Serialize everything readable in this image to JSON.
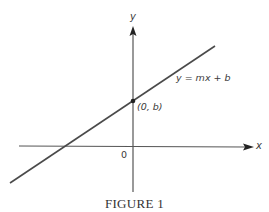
{
  "figure": {
    "caption": "FIGURE 1",
    "axes": {
      "x_label": "x",
      "y_label": "y",
      "origin_label": "0"
    },
    "line": {
      "equation_label": "y = mx + b",
      "intercept_label": "(0, b)"
    },
    "colors": {
      "ink": "#3a3a3a",
      "background": "#ffffff"
    }
  }
}
